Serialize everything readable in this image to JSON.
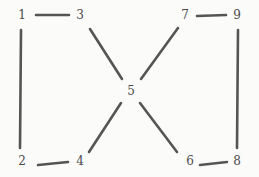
{
  "figure": {
    "background_color": "#fbfbfa",
    "edge_color": "#555555",
    "label_color": "#4a4a4a",
    "width": 259,
    "height": 177
  },
  "chart_data": {
    "type": "diagram",
    "graph_kind": "node-link-graph",
    "title": "",
    "nodes": [
      {
        "id": "1",
        "label": "1",
        "x": 22,
        "y": 15
      },
      {
        "id": "2",
        "label": "2",
        "x": 22,
        "y": 161
      },
      {
        "id": "3",
        "label": "3",
        "x": 80,
        "y": 15
      },
      {
        "id": "4",
        "label": "4",
        "x": 80,
        "y": 161
      },
      {
        "id": "5",
        "label": "5",
        "x": 131,
        "y": 91
      },
      {
        "id": "6",
        "label": "6",
        "x": 190,
        "y": 161
      },
      {
        "id": "7",
        "label": "7",
        "x": 185,
        "y": 15
      },
      {
        "id": "8",
        "label": "8",
        "x": 237,
        "y": 161
      },
      {
        "id": "9",
        "label": "9",
        "x": 237,
        "y": 15
      }
    ],
    "edges": [
      {
        "source": "1",
        "target": "3",
        "x1": 36,
        "y1": 15,
        "x2": 69,
        "y2": 15
      },
      {
        "source": "1",
        "target": "2",
        "x1": 21,
        "y1": 30,
        "x2": 20,
        "y2": 148
      },
      {
        "source": "2",
        "target": "4",
        "x1": 38,
        "y1": 165,
        "x2": 68,
        "y2": 162
      },
      {
        "source": "3",
        "target": "5",
        "x1": 90,
        "y1": 29,
        "x2": 122,
        "y2": 79
      },
      {
        "source": "4",
        "target": "5",
        "x1": 89,
        "y1": 152,
        "x2": 121,
        "y2": 103
      },
      {
        "source": "5",
        "target": "6",
        "x1": 140,
        "y1": 103,
        "x2": 177,
        "y2": 152
      },
      {
        "source": "5",
        "target": "7",
        "x1": 141,
        "y1": 79,
        "x2": 178,
        "y2": 28
      },
      {
        "source": "6",
        "target": "8",
        "x1": 200,
        "y1": 165,
        "x2": 227,
        "y2": 162
      },
      {
        "source": "7",
        "target": "9",
        "x1": 197,
        "y1": 16,
        "x2": 226,
        "y2": 15
      },
      {
        "source": "8",
        "target": "9",
        "x1": 237,
        "y1": 148,
        "x2": 238,
        "y2": 30
      }
    ],
    "edge_list_text": "1-3, 1-2, 2-4, 3-5, 4-5, 5-6, 5-7, 6-8, 7-9, 8-9",
    "node_count": 9,
    "edge_count": 10
  }
}
